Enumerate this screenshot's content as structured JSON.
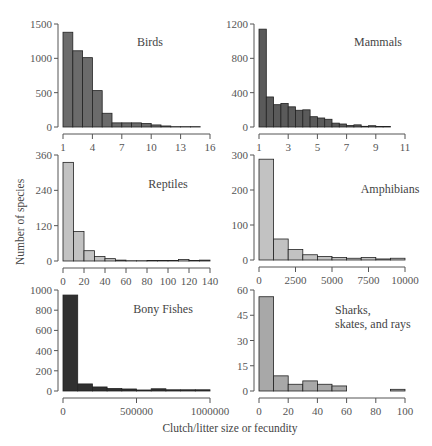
{
  "xlabel": "Clutch/litter size or fecundity",
  "ylabel": "Number of species",
  "chart_data": [
    {
      "type": "bar",
      "title": "Birds",
      "color": "#6b6b6b",
      "xticks": [
        "1",
        "4",
        "7",
        "10",
        "13",
        "16"
      ],
      "yticks": [
        "0",
        "500",
        "1000",
        "1500"
      ],
      "xlim": [
        1,
        16
      ],
      "ylim": [
        0,
        1500
      ],
      "bin_width": 1,
      "bin_start": 1,
      "values": [
        1380,
        1110,
        1010,
        530,
        200,
        60,
        60,
        60,
        50,
        30,
        15,
        5,
        5,
        5
      ]
    },
    {
      "type": "bar",
      "title": "Mammals",
      "color": "#5a5a5a",
      "xticks": [
        "1",
        "3",
        "5",
        "7",
        "9",
        "11"
      ],
      "yticks": [
        "0",
        "400",
        "800",
        "1200"
      ],
      "xlim": [
        1,
        11
      ],
      "ylim": [
        0,
        1200
      ],
      "bin_width": 0.5,
      "bin_start": 1,
      "values": [
        1140,
        350,
        260,
        275,
        235,
        195,
        200,
        120,
        105,
        90,
        45,
        35,
        18,
        25,
        8,
        15,
        5,
        5
      ]
    },
    {
      "type": "bar",
      "title": "Reptiles",
      "color": "#c2c2c2",
      "xticks": [
        "0",
        "20",
        "40",
        "60",
        "80",
        "100",
        "120",
        "140"
      ],
      "yticks": [
        "0",
        "120",
        "240",
        "360"
      ],
      "xlim": [
        0,
        140
      ],
      "ylim": [
        0,
        360
      ],
      "bin_width": 10,
      "bin_start": 0,
      "values": [
        335,
        100,
        35,
        15,
        8,
        3,
        1,
        1,
        2,
        2,
        2,
        5,
        2,
        3
      ]
    },
    {
      "type": "bar",
      "title": "Amphibians",
      "color": "#c2c2c2",
      "xticks": [
        "0",
        "2500",
        "5000",
        "7500",
        "10000"
      ],
      "yticks": [
        "0",
        "100",
        "200",
        "300"
      ],
      "xlim": [
        0,
        10000
      ],
      "ylim": [
        0,
        300
      ],
      "bin_width": 1000,
      "bin_start": 0,
      "values": [
        288,
        60,
        30,
        15,
        10,
        7,
        5,
        7,
        3,
        5
      ]
    },
    {
      "type": "bar",
      "title": "Bony Fishes",
      "color": "#303030",
      "xticks": [
        "0",
        "500000",
        "1000000"
      ],
      "yticks": [
        "0",
        "200",
        "400",
        "600",
        "800",
        "1000"
      ],
      "xlim": [
        0,
        1000000
      ],
      "ylim": [
        0,
        1000
      ],
      "bin_width": 100000,
      "bin_start": 0,
      "values": [
        950,
        70,
        40,
        25,
        20,
        10,
        22,
        12,
        12,
        12
      ]
    },
    {
      "type": "bar",
      "title": "Sharks, skates, and rays",
      "title_lines": [
        "Sharks,",
        "skates, and rays"
      ],
      "color": "#a8a8a8",
      "xticks": [
        "0",
        "20",
        "40",
        "60",
        "80",
        "100"
      ],
      "yticks": [
        "0",
        "15",
        "30",
        "45",
        "60"
      ],
      "xlim": [
        0,
        100
      ],
      "ylim": [
        0,
        60
      ],
      "bin_width": 10,
      "bin_start": 0,
      "values": [
        56,
        9,
        4,
        6,
        4,
        3,
        0,
        0,
        0,
        1
      ]
    }
  ]
}
